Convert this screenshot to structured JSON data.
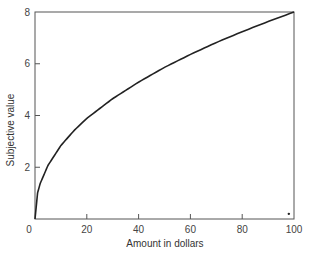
{
  "chart_data": {
    "type": "line",
    "title": "",
    "xlabel": "Amount in dollars",
    "ylabel": "Subjective value",
    "xlim": [
      0,
      100
    ],
    "ylim": [
      0,
      8
    ],
    "xticks": [
      0,
      20,
      40,
      60,
      80,
      100
    ],
    "yticks": [
      2,
      4,
      6,
      8
    ],
    "grid": false,
    "legend": null,
    "series": [
      {
        "name": "Subjective value curve",
        "x": [
          0,
          1,
          2,
          5,
          10,
          15,
          20,
          30,
          40,
          50,
          60,
          70,
          80,
          90,
          100
        ],
        "y": [
          0,
          1.01,
          1.37,
          2.07,
          2.84,
          3.41,
          3.89,
          4.65,
          5.29,
          5.86,
          6.36,
          6.82,
          7.24,
          7.63,
          8.0
        ]
      }
    ],
    "annotations": [
      {
        "type": "dot",
        "x": 98,
        "y": 0.2
      }
    ],
    "colors": {
      "line": "#222222",
      "axis": "#555555"
    }
  }
}
